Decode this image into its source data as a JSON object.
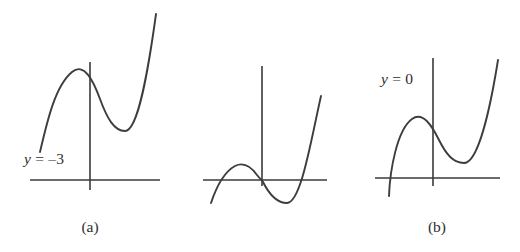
{
  "figure": {
    "type": "math-figure",
    "background_color": "#ffffff",
    "line_color": "#3d3d3d",
    "axis_color": "#3a3a3a"
  },
  "panels": [
    {
      "id": "a",
      "caption": "(a)",
      "level_label": {
        "variable": "y",
        "equals": "=",
        "value": "–3",
        "full": "y = –3"
      },
      "roots_visible": 0,
      "curve_position": "entirely above the x-axis",
      "local_max_above_axis": true,
      "local_min_above_axis": true
    },
    {
      "id": "b",
      "caption": "(b)",
      "level_label": {
        "variable": "y",
        "equals": "=",
        "value": "0",
        "full": "y = 0"
      },
      "roots_visible": 3,
      "curve_position": "crosses the x-axis three times through the origin",
      "local_max_above_axis": true,
      "local_min_above_axis": false
    },
    {
      "id": "c",
      "caption": "(c)",
      "level_label": {
        "variable": "y",
        "equals": "=",
        "value": "2",
        "full": "y = 2"
      },
      "roots_visible": 1,
      "curve_position": "crosses the x-axis once on the left",
      "local_max_above_axis": true,
      "local_min_above_axis": true
    }
  ]
}
